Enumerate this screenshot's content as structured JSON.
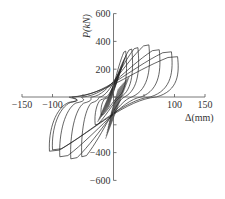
{
  "chart_data": {
    "type": "line",
    "title": "",
    "xlabel": "Δ(mm)",
    "ylabel": "P(kN)",
    "xlim": [
      -150,
      150
    ],
    "ylim": [
      -600,
      600
    ],
    "xticks": [
      -150,
      -100,
      -50,
      0,
      50,
      100,
      150
    ],
    "xtick_labels": [
      "−150",
      "−100",
      "−50",
      "",
      "50",
      "100",
      "150"
    ],
    "yticks": [
      -600,
      -400,
      -200,
      0,
      200,
      400,
      600
    ],
    "ytick_labels": [
      "−600",
      "−400",
      "−200",
      "",
      "200",
      "400",
      "600"
    ],
    "grid": false,
    "legend": null,
    "series": [
      {
        "name": "cycle-1",
        "peak_pos": [
          20,
          330
        ],
        "peak_neg": [
          -20,
          -130
        ],
        "residual": [
          8,
          -8
        ]
      },
      {
        "name": "cycle-2",
        "peak_pos": [
          30,
          345
        ],
        "peak_neg": [
          -30,
          -200
        ],
        "residual": [
          12,
          -12
        ]
      },
      {
        "name": "cycle-3",
        "peak_pos": [
          40,
          355
        ],
        "peak_neg": [
          -52,
          -430
        ],
        "residual": [
          18,
          -22
        ]
      },
      {
        "name": "cycle-4",
        "peak_pos": [
          58,
          375
        ],
        "peak_neg": [
          -70,
          -445
        ],
        "residual": [
          30,
          -35
        ]
      },
      {
        "name": "cycle-5",
        "peak_pos": [
          75,
          340
        ],
        "peak_neg": [
          -88,
          -430
        ],
        "residual": [
          45,
          -50
        ]
      },
      {
        "name": "cycle-6",
        "peak_pos": [
          95,
          325
        ],
        "peak_neg": [
          -105,
          -390
        ],
        "residual": [
          60,
          -65
        ]
      },
      {
        "name": "cycle-7",
        "peak_pos": [
          105,
          290
        ],
        "peak_neg": [
          -100,
          -380
        ],
        "residual": [
          70,
          -70
        ]
      }
    ],
    "colors": {
      "curve": "#222222",
      "axis": "#555555",
      "text": "#333333"
    }
  }
}
